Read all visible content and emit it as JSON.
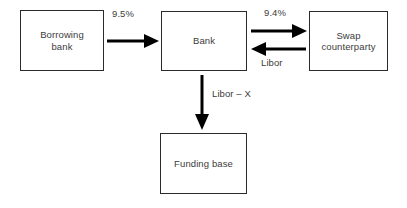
{
  "diagram": {
    "line_color": "#2b2b2b",
    "arrow_color": "#000000",
    "text_color": "#3c3c3c",
    "background": "#ffffff",
    "nodes": [
      {
        "id": "borrowing_bank",
        "label": "Borrowing\nbank"
      },
      {
        "id": "bank",
        "label": "Bank"
      },
      {
        "id": "swap_counterparty",
        "label": "Swap\ncounterparty"
      },
      {
        "id": "funding_base",
        "label": "Funding base"
      }
    ],
    "edges": [
      {
        "id": "borrowing_to_bank",
        "from": "borrowing_bank",
        "to": "bank",
        "label": "9.5%",
        "direction": "right"
      },
      {
        "id": "bank_to_swap",
        "from": "bank",
        "to": "swap_counterparty",
        "label": "9.4%",
        "direction": "right"
      },
      {
        "id": "swap_to_bank",
        "from": "swap_counterparty",
        "to": "bank",
        "label": "Libor",
        "direction": "left"
      },
      {
        "id": "bank_to_funding",
        "from": "bank",
        "to": "funding_base",
        "label": "Libor – X",
        "direction": "down"
      }
    ]
  }
}
